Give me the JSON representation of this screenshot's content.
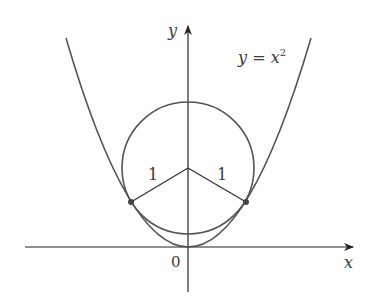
{
  "diagram": {
    "curve_label": "y = x",
    "curve_label_parts": {
      "y": "y",
      "eq": " = ",
      "x": "x",
      "exp": "2"
    },
    "axis_x_label": "x",
    "axis_y_label": "y",
    "origin_label": "0",
    "radius_left_label": "1",
    "radius_right_label": "1",
    "colors": {
      "curve": "#555555",
      "axis": "#222222",
      "text": "#3a3a3a"
    }
  }
}
